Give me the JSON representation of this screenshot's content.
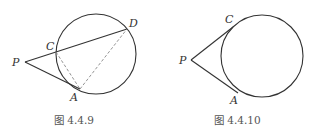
{
  "figures": [
    {
      "caption": "图 4.4.9",
      "circle": {
        "cx": 96,
        "cy": 54,
        "r": 40
      },
      "points": {
        "P": {
          "label": "P",
          "x": 25,
          "y": 62
        },
        "C": {
          "label": "C",
          "x": 56,
          "y": 52
        },
        "D": {
          "label": "D",
          "x": 127,
          "y": 29
        },
        "A": {
          "label": "A",
          "x": 80,
          "y": 89
        }
      },
      "solid_segments": [
        [
          "P",
          "D"
        ],
        [
          "P",
          "A"
        ]
      ],
      "dashed_segments": [
        [
          "C",
          "A"
        ],
        [
          "A",
          "D"
        ]
      ]
    },
    {
      "caption": "图 4.4.10",
      "circle": {
        "cx": 262,
        "cy": 56,
        "r": 41
      },
      "points": {
        "P": {
          "label": "P",
          "x": 191,
          "y": 60
        },
        "C": {
          "label": "C",
          "x": 233,
          "y": 27
        },
        "A": {
          "label": "A",
          "x": 238,
          "y": 93
        }
      },
      "solid_segments": [
        [
          "P",
          "C"
        ],
        [
          "P",
          "A"
        ]
      ],
      "dashed_segments": []
    }
  ],
  "colors": {
    "line": "#333333",
    "dashed": "#888888",
    "caption": "#555555",
    "background": "#ffffff"
  }
}
